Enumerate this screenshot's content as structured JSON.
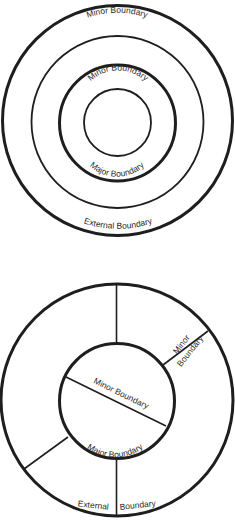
{
  "diagram_top": {
    "description": "Concentric boundary rings",
    "labels": {
      "minor_outer": "Minor  Boundary",
      "minor_inner": "Minor Boundary",
      "major": "Major  Boundary",
      "external": "External  Boundary"
    }
  },
  "diagram_bottom": {
    "description": "Sectored boundary rings",
    "labels": {
      "minor_right_1": "Minor",
      "minor_right_2": "Boundary",
      "minor_chord": "Minor Boundary",
      "major": "Major Boundary",
      "external_left": "External",
      "external_right": "Boundary"
    }
  },
  "colors": {
    "line": "#1e1e1e",
    "text": "#2a2a2a",
    "background": "#ffffff"
  }
}
